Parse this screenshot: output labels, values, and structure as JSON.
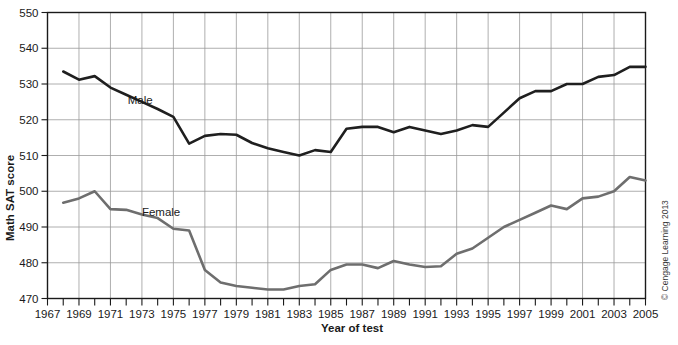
{
  "chart_data": {
    "type": "line",
    "title": "",
    "xlabel": "Year of test",
    "ylabel": "Math SAT score",
    "xlim": [
      1967,
      2005
    ],
    "ylim": [
      470,
      550
    ],
    "grid": true,
    "legend_position": "inline-labels",
    "xticks": [
      1967,
      1968,
      1969,
      1970,
      1971,
      1972,
      1973,
      1974,
      1975,
      1976,
      1977,
      1978,
      1979,
      1980,
      1981,
      1982,
      1983,
      1984,
      1985,
      1986,
      1987,
      1988,
      1989,
      1990,
      1991,
      1992,
      1993,
      1994,
      1995,
      1996,
      1997,
      1998,
      1999,
      2000,
      2001,
      2002,
      2003,
      2004,
      2005
    ],
    "xtick_labels": [
      "1967",
      "1969",
      "1971",
      "1973",
      "1975",
      "1977",
      "1979",
      "1981",
      "1983",
      "1985",
      "1987",
      "1989",
      "1991",
      "1993",
      "1995",
      "1997",
      "1999",
      "2001",
      "2003",
      "2005"
    ],
    "xtick_label_values": [
      1967,
      1969,
      1971,
      1973,
      1975,
      1977,
      1979,
      1981,
      1983,
      1985,
      1987,
      1989,
      1991,
      1993,
      1995,
      1997,
      1999,
      2001,
      2003,
      2005
    ],
    "yticks": [
      470,
      480,
      490,
      500,
      510,
      520,
      530,
      540,
      550
    ],
    "ytick_labels": [
      "470",
      "480",
      "490",
      "500",
      "510",
      "520",
      "530",
      "540",
      "550"
    ],
    "x": [
      1968,
      1969,
      1970,
      1971,
      1972,
      1973,
      1974,
      1975,
      1976,
      1977,
      1978,
      1979,
      1980,
      1981,
      1982,
      1983,
      1984,
      1985,
      1986,
      1987,
      1988,
      1989,
      1990,
      1991,
      1992,
      1993,
      1994,
      1995,
      1996,
      1997,
      1998,
      1999,
      2000,
      2001,
      2002,
      2003,
      2004,
      2005
    ],
    "series": [
      {
        "name": "Male",
        "color": "#1f1f1f",
        "label_x": 1972.1,
        "label_y": 524.5,
        "values": [
          533.5,
          531.2,
          532.2,
          529.0,
          527.0,
          525.0,
          523.0,
          520.8,
          513.3,
          515.5,
          516.0,
          515.8,
          513.5,
          512.0,
          511.0,
          510.0,
          511.5,
          511.0,
          517.5,
          518.0,
          518.0,
          516.5,
          518.0,
          517.0,
          516.0,
          517.0,
          518.5,
          518.0,
          522.0,
          526.0,
          528.0,
          528.0,
          530.0,
          530.0,
          532.0,
          532.5,
          534.8,
          534.8
        ]
      },
      {
        "name": "Female",
        "color": "#6e6e6e",
        "label_x": 1973.0,
        "label_y": 493.0,
        "values": [
          496.8,
          498.0,
          500.0,
          495.0,
          494.8,
          493.5,
          492.5,
          489.5,
          489.0,
          478.0,
          474.5,
          473.5,
          473.0,
          472.5,
          472.5,
          473.5,
          474.0,
          478.0,
          479.5,
          479.5,
          478.5,
          480.5,
          479.5,
          478.8,
          479.0,
          482.5,
          484.0,
          487.0,
          490.0,
          492.0,
          494.0,
          496.0,
          495.0,
          498.0,
          498.5,
          500.0,
          504.0,
          503.0
        ]
      }
    ],
    "annotations": [
      {
        "text": "Male",
        "x": 1972.1,
        "y": 524.5
      },
      {
        "text": "Female",
        "x": 1973.0,
        "y": 493.0
      }
    ]
  },
  "credit": {
    "text": "© Cengage Learning 2013"
  }
}
